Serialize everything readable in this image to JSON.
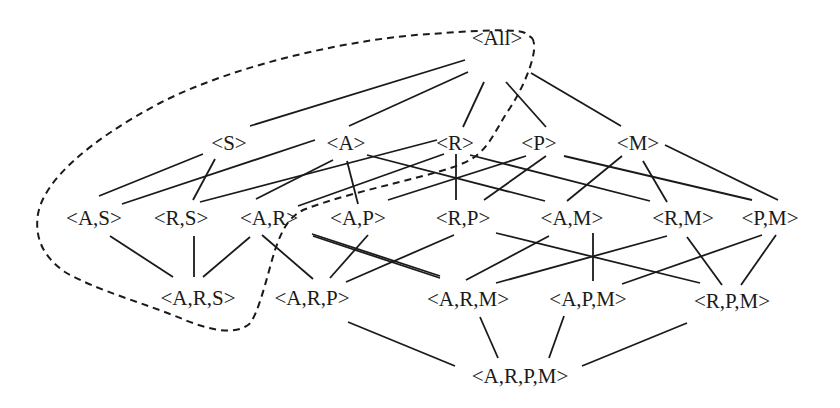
{
  "diagram": {
    "type": "lattice",
    "colors": {
      "line": "#1a1a1a",
      "background": "#ffffff",
      "text": "#1a1a1a"
    },
    "nodes": [
      {
        "id": "All",
        "label": "<All>",
        "x": 497,
        "y": 38
      },
      {
        "id": "S",
        "label": "<S>",
        "x": 229,
        "y": 143
      },
      {
        "id": "A",
        "label": "<A>",
        "x": 346,
        "y": 143
      },
      {
        "id": "R",
        "label": "<R>",
        "x": 455,
        "y": 143
      },
      {
        "id": "P",
        "label": "<P>",
        "x": 539,
        "y": 143
      },
      {
        "id": "M",
        "label": "<M>",
        "x": 638,
        "y": 143
      },
      {
        "id": "AS",
        "label": "<A,S>",
        "x": 94,
        "y": 218
      },
      {
        "id": "RS",
        "label": "<R,S>",
        "x": 181,
        "y": 218
      },
      {
        "id": "AR",
        "label": "<A,R>",
        "x": 269,
        "y": 218
      },
      {
        "id": "AP",
        "label": "<A,P>",
        "x": 358,
        "y": 218
      },
      {
        "id": "RP",
        "label": "<R,P>",
        "x": 463,
        "y": 218
      },
      {
        "id": "AM",
        "label": "<A,M>",
        "x": 572,
        "y": 218
      },
      {
        "id": "RM",
        "label": "<R,M>",
        "x": 683,
        "y": 218
      },
      {
        "id": "PM",
        "label": "<P,M>",
        "x": 770,
        "y": 218
      },
      {
        "id": "ARS",
        "label": "<A,R,S>",
        "x": 198,
        "y": 298
      },
      {
        "id": "ARP",
        "label": "<A,R,P>",
        "x": 312,
        "y": 298
      },
      {
        "id": "ARM",
        "label": "<A,R,M>",
        "x": 468,
        "y": 299
      },
      {
        "id": "APM",
        "label": "<A,P,M>",
        "x": 588,
        "y": 299
      },
      {
        "id": "RPM",
        "label": "<R,P,M>",
        "x": 732,
        "y": 301
      },
      {
        "id": "ARPM",
        "label": "<A,R,P,M>",
        "x": 520,
        "y": 376
      }
    ],
    "edges": [
      {
        "from": "All",
        "to": "S",
        "line": [
          465,
          60,
          250,
          126
        ]
      },
      {
        "from": "All",
        "to": "A",
        "line": [
          468,
          72,
          349,
          126
        ]
      },
      {
        "from": "All",
        "to": "R",
        "line": [
          484,
          82,
          463,
          127
        ]
      },
      {
        "from": "All",
        "to": "P",
        "line": [
          506,
          82,
          546,
          127
        ]
      },
      {
        "from": "All",
        "to": "M",
        "line": [
          531,
          73,
          621,
          126
        ]
      },
      {
        "from": "S",
        "to": "AS",
        "line": [
          203,
          154,
          99,
          196
        ]
      },
      {
        "from": "S",
        "to": "RS",
        "line": [
          215,
          159,
          193,
          200
        ]
      },
      {
        "from": "A",
        "to": "AS",
        "line": [
          315,
          140,
          122,
          204
        ]
      },
      {
        "from": "A",
        "to": "AR",
        "line": [
          333,
          160,
          256,
          199
        ]
      },
      {
        "from": "A",
        "to": "AP",
        "line": [
          347,
          161,
          358,
          204
        ]
      },
      {
        "from": "A",
        "to": "AM",
        "line": [
          367,
          155,
          545,
          201
        ]
      },
      {
        "from": "R",
        "to": "RS",
        "line": [
          437,
          140,
          200,
          202
        ]
      },
      {
        "from": "R",
        "to": "AR",
        "line": [
          444,
          154,
          298,
          206
        ]
      },
      {
        "from": "R",
        "to": "RP",
        "line": [
          456,
          154,
          456,
          200
        ]
      },
      {
        "from": "R",
        "to": "RM",
        "line": [
          470,
          155,
          650,
          201
        ]
      },
      {
        "from": "P",
        "to": "AP",
        "line": [
          526,
          156,
          388,
          200
        ]
      },
      {
        "from": "P",
        "to": "RP",
        "line": [
          546,
          156,
          484,
          200
        ]
      },
      {
        "from": "P",
        "to": "PM",
        "line": [
          564,
          156,
          752,
          200
        ]
      },
      {
        "from": "M",
        "to": "AM",
        "line": [
          622,
          156,
          567,
          201
        ]
      },
      {
        "from": "M",
        "to": "RM",
        "line": [
          643,
          161,
          667,
          202
        ]
      },
      {
        "from": "M",
        "to": "PM",
        "line": [
          665,
          145,
          778,
          200
        ]
      },
      {
        "from": "AS",
        "to": "ARS",
        "line": [
          110,
          236,
          173,
          277
        ]
      },
      {
        "from": "RS",
        "to": "ARS",
        "line": [
          194,
          236,
          194,
          277
        ]
      },
      {
        "from": "AR",
        "to": "ARS",
        "line": [
          250,
          237,
          203,
          277
        ]
      },
      {
        "from": "AR",
        "to": "ARP",
        "line": [
          262,
          235,
          313,
          279
        ]
      },
      {
        "from": "AP",
        "to": "ARP",
        "line": [
          368,
          235,
          330,
          278
        ]
      },
      {
        "from": "AP",
        "to": "APM",
        "line": [
          312,
          234,
          440,
          276
        ]
      },
      {
        "from": "RP",
        "to": "ARP",
        "line": [
          454,
          235,
          346,
          282
        ]
      },
      {
        "from": "RP",
        "to": "RPM",
        "line": [
          496,
          233,
          700,
          283
        ]
      },
      {
        "from": "AM",
        "to": "ARM",
        "line": [
          549,
          236,
          466,
          280
        ]
      },
      {
        "from": "AM",
        "to": "APM",
        "line": [
          593,
          233,
          593,
          281
        ]
      },
      {
        "from": "RM",
        "to": "ARM",
        "line": [
          667,
          236,
          496,
          283
        ]
      },
      {
        "from": "RM",
        "to": "RPM",
        "line": [
          687,
          237,
          722,
          285
        ]
      },
      {
        "from": "PM",
        "to": "APM",
        "line": [
          762,
          235,
          622,
          284
        ]
      },
      {
        "from": "PM",
        "to": "RPM",
        "line": [
          776,
          235,
          741,
          285
        ]
      },
      {
        "from": "AR",
        "to": "ARM",
        "line": [
          313,
          236,
          440,
          278
        ]
      },
      {
        "from": "ARP",
        "to": "ARPM",
        "line": [
          348,
          322,
          455,
          366
        ]
      },
      {
        "from": "ARM",
        "to": "ARPM",
        "line": [
          480,
          317,
          498,
          358
        ]
      },
      {
        "from": "APM",
        "to": "ARPM",
        "line": [
          564,
          316,
          549,
          358
        ]
      },
      {
        "from": "RPM",
        "to": "ARPM",
        "line": [
          687,
          323,
          582,
          366
        ]
      }
    ],
    "region": {
      "style": "dashed",
      "encloses": [
        "All",
        "S",
        "A",
        "R",
        "AS",
        "RS",
        "AR",
        "ARS"
      ],
      "path": "M 532 38 C 540 48, 525 85, 510 108 C 495 130, 490 148, 470 160 C 440 176, 360 188, 303 210 C 288 218, 282 230, 275 250 C 268 272, 258 318, 248 325 C 235 334, 215 332, 185 320 C 150 305, 95 290, 65 272 C 45 258, 34 240, 38 214 C 44 180, 90 140, 160 103 C 240 62, 360 38, 430 34 C 470 31, 515 28, 525 33 Z"
    }
  }
}
